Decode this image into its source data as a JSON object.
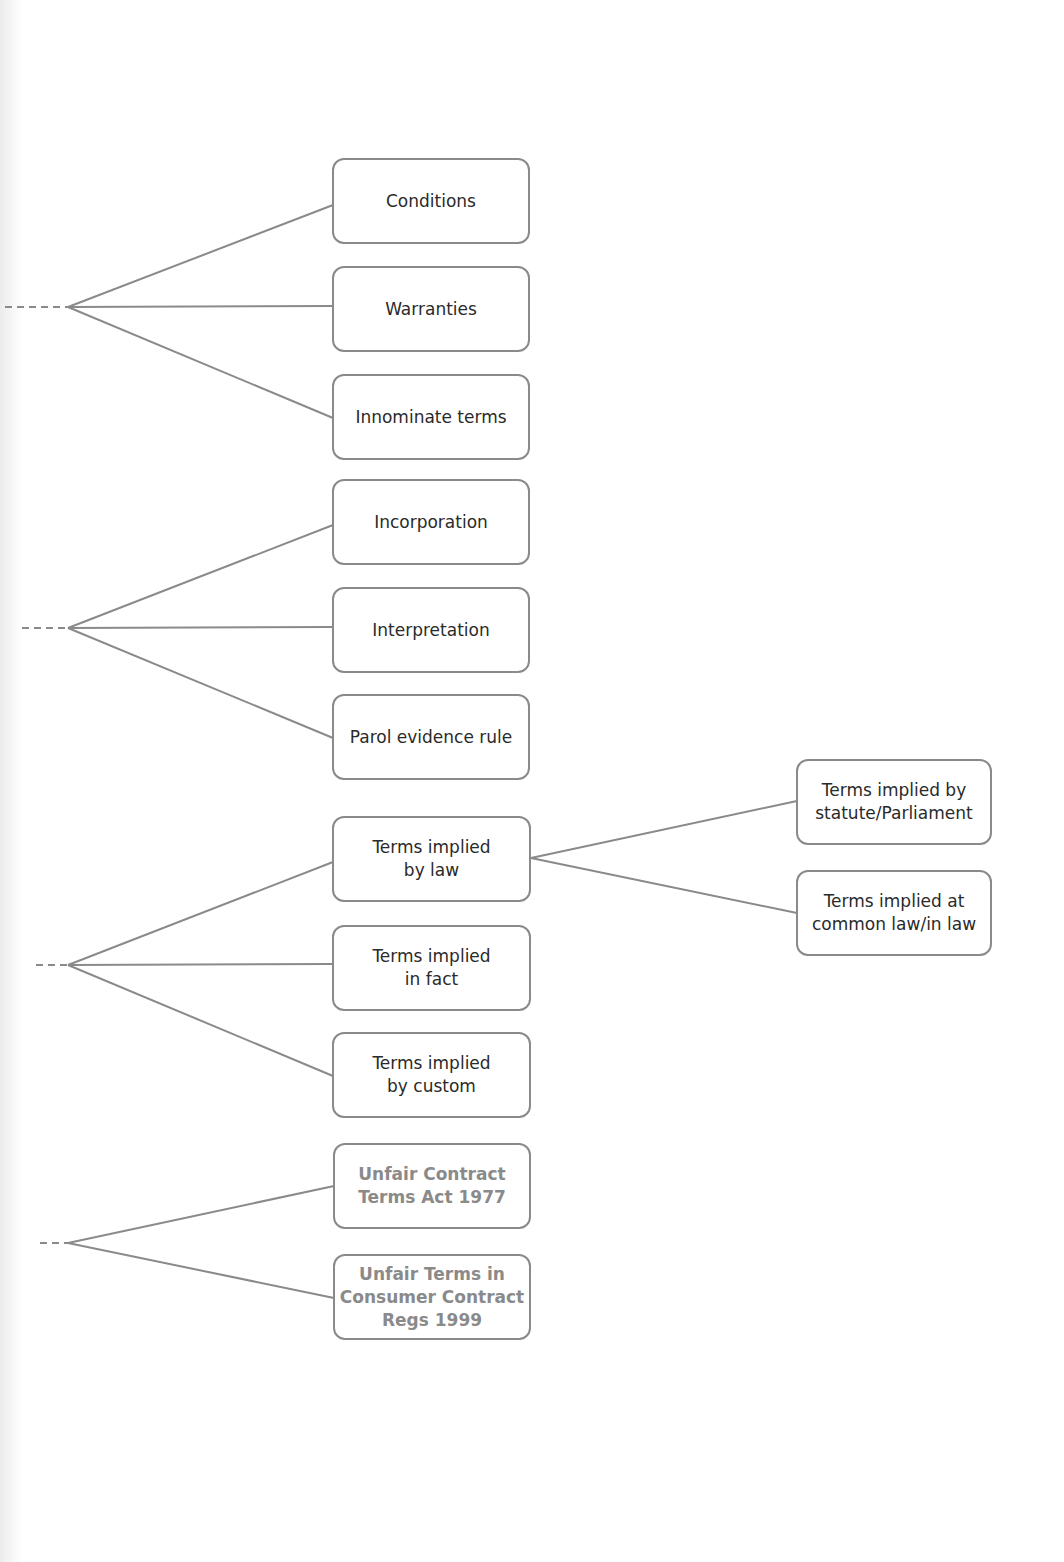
{
  "diagram": {
    "groups": [
      {
        "id": "g1",
        "branch_point": [
          68,
          307
        ],
        "children": [
          {
            "label": "Conditions",
            "style": "normal"
          },
          {
            "label": "Warranties",
            "style": "normal"
          },
          {
            "label": "Innominate terms",
            "style": "normal"
          }
        ]
      },
      {
        "id": "g2",
        "branch_point": [
          68,
          628
        ],
        "children": [
          {
            "label": "Incorporation",
            "style": "normal"
          },
          {
            "label": "Interpretation",
            "style": "normal"
          },
          {
            "label": "Parol evidence rule",
            "style": "normal"
          }
        ]
      },
      {
        "id": "g3",
        "branch_point": [
          68,
          965
        ],
        "children": [
          {
            "label": "Terms implied\nby law",
            "style": "normal",
            "children": [
              {
                "label": "Terms implied by\nstatute/Parliament"
              },
              {
                "label": "Terms implied at\ncommon law/in law"
              }
            ]
          },
          {
            "label": "Terms implied\nin fact",
            "style": "normal"
          },
          {
            "label": "Terms implied\nby custom",
            "style": "normal"
          }
        ]
      },
      {
        "id": "g4",
        "branch_point": [
          68,
          1243
        ],
        "children": [
          {
            "label": "Unfair Contract\nTerms Act 1977",
            "style": "muted"
          },
          {
            "label": "Unfair Terms in\nConsumer Contract\nRegs 1999",
            "style": "muted"
          }
        ]
      }
    ],
    "colors": {
      "line": "#8a8a8a",
      "text": "#2a2a2a",
      "muted_text": "#8a8a8a"
    }
  }
}
